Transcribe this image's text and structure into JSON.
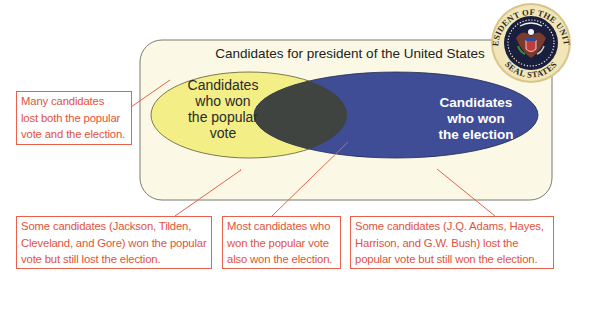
{
  "diagram": {
    "type": "venn",
    "title": "Candidates for president of the United States",
    "sets": [
      {
        "id": "popular",
        "label": "Candidates who won the popular vote",
        "lines": [
          "Candidates",
          "who won",
          "the popular",
          "vote"
        ],
        "color": "#f3ee86"
      },
      {
        "id": "election",
        "label": "Candidates who won the election",
        "lines": [
          "Candidates",
          "who won",
          "the election"
        ],
        "color": "#3f4d96"
      }
    ],
    "intersection": {
      "color": "#3f4441"
    },
    "universe_color": "#fbf9e6",
    "callout_color": "#e8614b",
    "seal": {
      "name": "Seal of the President of the United States",
      "ring_text_top": "PRESIDENT OF THE UNITED",
      "ring_text_bottom": "SEAL STATES"
    },
    "callouts": [
      {
        "id": "neither",
        "lines": [
          "Many candidates",
          "lost both the popular",
          "vote and the election."
        ]
      },
      {
        "id": "popular-only",
        "lines": [
          "Some candidates (Jackson, Tilden,",
          "Cleveland, and Gore) won the popular",
          "vote but still lost the election."
        ]
      },
      {
        "id": "both",
        "lines": [
          "Most candidates who",
          "won the popular vote",
          "also won the election."
        ]
      },
      {
        "id": "election-only",
        "lines": [
          "Some candidates (J.Q. Adams, Hayes,",
          "Harrison, and G.W. Bush) lost the",
          "popular vote but still won the election."
        ]
      }
    ]
  }
}
